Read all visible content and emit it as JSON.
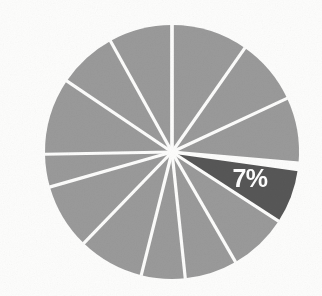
{
  "chart_data": {
    "type": "pie",
    "title": "",
    "subtitle": "",
    "xlabel": "",
    "ylabel": "",
    "legend": "none",
    "grid": false,
    "units": "percent",
    "total": 100,
    "start_angle_deg": 0,
    "direction": "clockwise",
    "highlight_index": 3,
    "colors": {
      "slice_default": "#9a9a9a",
      "slice_highlight": "#575757",
      "divider": "#fdfdfc",
      "label_text": "#ffffff",
      "background": "#fdfdfc"
    },
    "geometry": {
      "center_x": 172,
      "center_y": 152,
      "radius": 127,
      "divider_width": 3.2
    },
    "categories": [
      "Segment 1",
      "Segment 2",
      "Segment 3",
      "Segment 4",
      "Segment 5",
      "Segment 6",
      "Segment 7",
      "Segment 8",
      "Segment 9",
      "Segment 10",
      "Segment 11",
      "Segment 12",
      "Segment 13"
    ],
    "values": [
      9.7,
      8.3,
      8.3,
      7,
      7.5,
      6.7,
      5.6,
      8.3,
      8.3,
      4.2,
      9.7,
      8.3,
      8.1
    ],
    "angles_deg": [
      35,
      30,
      30,
      25,
      27,
      24,
      20,
      30,
      30,
      15,
      35,
      30,
      29
    ],
    "slices": [
      {
        "index": 0,
        "label": "",
        "value": 9.7,
        "start_deg": 0,
        "end_deg": 35,
        "highlight": false,
        "color": "#9a9a9a"
      },
      {
        "index": 1,
        "label": "",
        "value": 8.3,
        "start_deg": 35,
        "end_deg": 65,
        "highlight": false,
        "color": "#9a9a9a"
      },
      {
        "index": 2,
        "label": "",
        "value": 8.3,
        "start_deg": 65,
        "end_deg": 95,
        "highlight": false,
        "color": "#9a9a9a"
      },
      {
        "index": 3,
        "label": "7%",
        "value": 7,
        "start_deg": 98,
        "end_deg": 123,
        "highlight": true,
        "color": "#575757"
      },
      {
        "index": 4,
        "label": "",
        "value": 7.5,
        "start_deg": 123,
        "end_deg": 150,
        "highlight": false,
        "color": "#9a9a9a"
      },
      {
        "index": 5,
        "label": "",
        "value": 6.7,
        "start_deg": 150,
        "end_deg": 174,
        "highlight": false,
        "color": "#9a9a9a"
      },
      {
        "index": 6,
        "label": "",
        "value": 5.6,
        "start_deg": 174,
        "end_deg": 194,
        "highlight": false,
        "color": "#9a9a9a"
      },
      {
        "index": 7,
        "label": "",
        "value": 8.3,
        "start_deg": 194,
        "end_deg": 224,
        "highlight": false,
        "color": "#9a9a9a"
      },
      {
        "index": 8,
        "label": "",
        "value": 8.3,
        "start_deg": 224,
        "end_deg": 254,
        "highlight": false,
        "color": "#9a9a9a"
      },
      {
        "index": 9,
        "label": "",
        "value": 4.2,
        "start_deg": 254,
        "end_deg": 269,
        "highlight": false,
        "color": "#9a9a9a"
      },
      {
        "index": 10,
        "label": "",
        "value": 9.7,
        "start_deg": 269,
        "end_deg": 304,
        "highlight": false,
        "color": "#9a9a9a"
      },
      {
        "index": 11,
        "label": "",
        "value": 8.3,
        "start_deg": 304,
        "end_deg": 331,
        "highlight": false,
        "color": "#9a9a9a"
      },
      {
        "index": 12,
        "label": "",
        "value": 8.1,
        "start_deg": 331,
        "end_deg": 360,
        "highlight": false,
        "color": "#9a9a9a"
      }
    ],
    "data_labels": [
      {
        "text": "7%",
        "slice_index": 3,
        "x": 250,
        "y": 187,
        "color": "#ffffff",
        "font_size": 25,
        "bold": true
      }
    ]
  }
}
